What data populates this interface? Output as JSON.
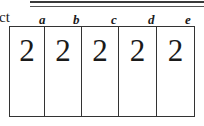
{
  "header": {
    "label_fragment": "ct"
  },
  "columns": [
    {
      "letter": "a",
      "value": "2",
      "width": 35
    },
    {
      "letter": "b",
      "value": "2",
      "width": 37
    },
    {
      "letter": "c",
      "value": "2",
      "width": 37
    },
    {
      "letter": "d",
      "value": "2",
      "width": 38
    },
    {
      "letter": "e",
      "value": "2",
      "width": 38
    }
  ]
}
